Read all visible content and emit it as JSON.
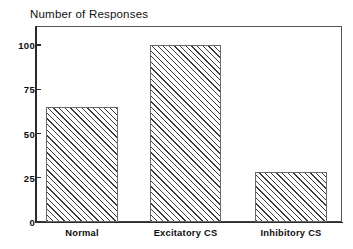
{
  "chart_data": {
    "type": "bar",
    "title": "Number of Responses",
    "xlabel": "",
    "ylabel": "",
    "categories": [
      "Normal",
      "Excitatory CS",
      "Inhibitory CS"
    ],
    "values": [
      65,
      100,
      28
    ],
    "ylim": [
      0,
      112
    ],
    "yticks": [
      0,
      25,
      50,
      75,
      100
    ],
    "ytick_labels": [
      "0",
      "25",
      "50",
      "75",
      "100"
    ],
    "grid": false,
    "legend": null,
    "bar_fill": "diagonal-hatch",
    "colors": {
      "axis": "#2b2b2b",
      "frame": "#555555",
      "hatch": "#3a3a3a",
      "bar_edge": "#6a6a6a",
      "background": "#ffffff",
      "text": "#0d0d0d"
    }
  },
  "axis": {
    "y_ticks": [
      {
        "label": "100",
        "value": 100
      },
      {
        "label": "75",
        "value": 75
      },
      {
        "label": "50",
        "value": 50
      },
      {
        "label": "25",
        "value": 25
      },
      {
        "label": "0",
        "value": 0
      }
    ],
    "x_ticks": [
      {
        "label": "Normal"
      },
      {
        "label": "Excitatory CS"
      },
      {
        "label": "Inhibitory CS"
      }
    ]
  },
  "bars": [
    {
      "label": "Normal",
      "value": 65
    },
    {
      "label": "Excitatory CS",
      "value": 100
    },
    {
      "label": "Inhibitory CS",
      "value": 28
    }
  ]
}
